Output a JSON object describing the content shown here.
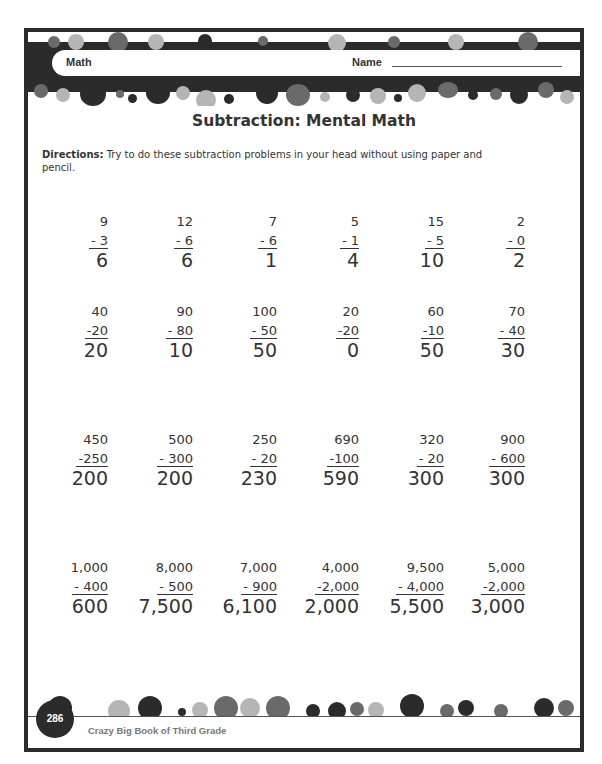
{
  "header": {
    "subject": "Math",
    "name_label": "Name",
    "name_value": ""
  },
  "title": "Subtraction: Mental Math",
  "directions": {
    "label": "Directions:",
    "text": " Try to do these subtraction problems in your head without using paper and pencil."
  },
  "rows": [
    [
      {
        "top": "9",
        "sub": "- 3",
        "ans": "6"
      },
      {
        "top": "12",
        "sub": "-  6",
        "ans": "6"
      },
      {
        "top": "7",
        "sub": "- 6",
        "ans": "1"
      },
      {
        "top": "5",
        "sub": "- 1",
        "ans": "4"
      },
      {
        "top": "15",
        "sub": "-  5",
        "ans": "10"
      },
      {
        "top": "2",
        "sub": "- 0",
        "ans": "2"
      }
    ],
    [
      {
        "top": "40",
        "sub": "-20",
        "ans": "20"
      },
      {
        "top": "90",
        "sub": "- 80",
        "ans": "10"
      },
      {
        "top": "100",
        "sub": "-  50",
        "ans": "50"
      },
      {
        "top": "20",
        "sub": "-20",
        "ans": "0"
      },
      {
        "top": "60",
        "sub": "-10",
        "ans": "50"
      },
      {
        "top": "70",
        "sub": "- 40",
        "ans": "30"
      }
    ],
    [
      {
        "top": "450",
        "sub": "-250",
        "ans": "200"
      },
      {
        "top": "500",
        "sub": "- 300",
        "ans": "200"
      },
      {
        "top": "250",
        "sub": "-   20",
        "ans": "230"
      },
      {
        "top": "690",
        "sub": "-100",
        "ans": "590"
      },
      {
        "top": "320",
        "sub": "-   20",
        "ans": "300"
      },
      {
        "top": "900",
        "sub": "- 600",
        "ans": "300"
      }
    ],
    [
      {
        "top": "1,000",
        "sub": "-   400",
        "ans": "600"
      },
      {
        "top": "8,000",
        "sub": "-   500",
        "ans": "7,500"
      },
      {
        "top": "7,000",
        "sub": "-   900",
        "ans": "6,100"
      },
      {
        "top": "4,000",
        "sub": "-2,000",
        "ans": "2,000"
      },
      {
        "top": "9,500",
        "sub": "- 4,000",
        "ans": "5,500"
      },
      {
        "top": "5,000",
        "sub": "-2,000",
        "ans": "3,000"
      }
    ]
  ],
  "footer": {
    "page_number": "286",
    "book_title": "Crazy Big Book of Third Grade"
  },
  "colors": {
    "border": "#2b2b2b",
    "dot_dark": "#2b2b2b",
    "dot_mid": "#6a6a6a",
    "dot_light": "#b5b5b5"
  }
}
